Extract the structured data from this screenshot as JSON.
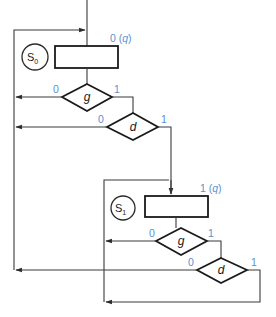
{
  "diagram": {
    "type": "ASM chart",
    "states": [
      {
        "name": "S0",
        "label_main": "S",
        "label_sub": "0",
        "output_label": "0 (q)",
        "output_value": "0",
        "output_signal": "q",
        "decisions": [
          {
            "variable": "g",
            "false_label": "0",
            "true_label": "1"
          },
          {
            "variable": "d",
            "false_label": "0",
            "true_label": "1"
          }
        ]
      },
      {
        "name": "S1",
        "label_main": "S",
        "label_sub": "1",
        "output_label": "1 (q)",
        "output_value": "1",
        "output_signal": "q",
        "decisions": [
          {
            "variable": "g",
            "false_label": "0",
            "true_label": "1"
          },
          {
            "variable": "d",
            "false_label": "0",
            "true_label": "1"
          }
        ]
      }
    ],
    "colors": {
      "label_blue": "#5b8fd0",
      "line": "#3a3a3a",
      "shape_stroke": "#1a1a1a"
    }
  }
}
